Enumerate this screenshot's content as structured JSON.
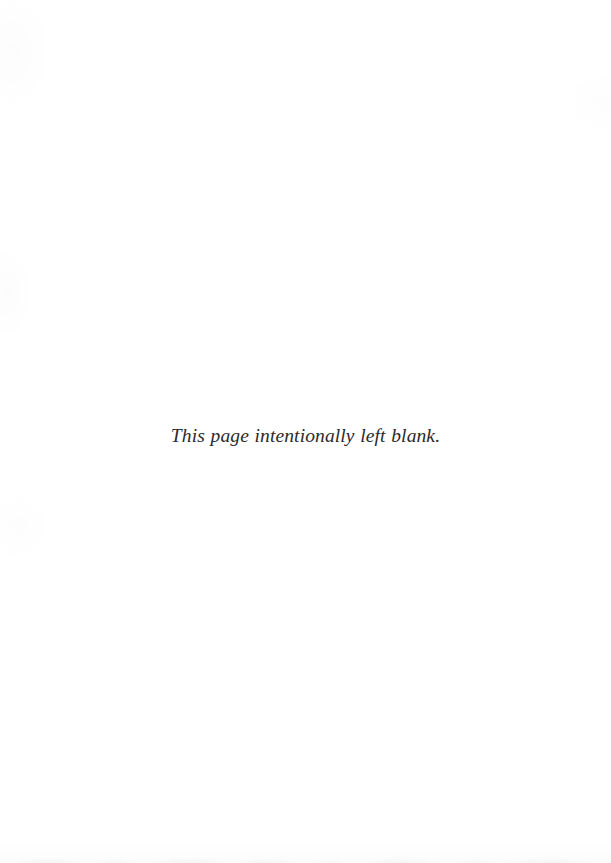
{
  "page": {
    "kind": "scanned-book-page",
    "background_color": "#ffffff",
    "width": 611,
    "height": 863
  },
  "notice": {
    "text": "This page intentionally left blank.",
    "color": "#2b2b2b",
    "style": "italic-serif",
    "alignment": "center"
  },
  "artifacts": {
    "bottom_edge_noise_label": "",
    "paper_texture_label": ""
  }
}
